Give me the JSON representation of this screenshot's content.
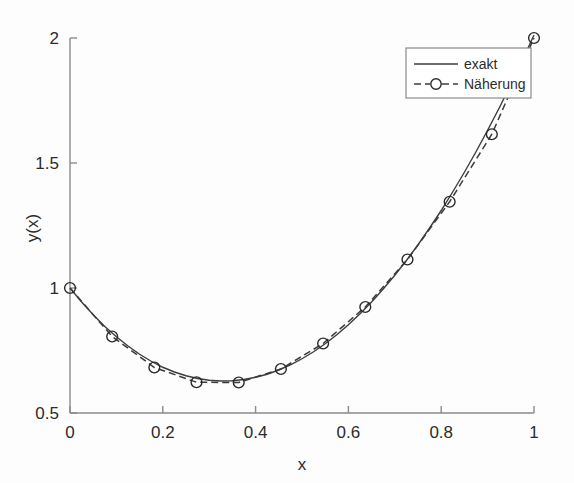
{
  "figure": {
    "background": "#fdfdfd",
    "line_color": "#3c3c3c",
    "axis_color": "#8a8a8a"
  },
  "chart_data": {
    "type": "line",
    "title": "",
    "xlabel": "x",
    "ylabel": "y(x)",
    "xlim": [
      0,
      1
    ],
    "ylim": [
      0.5,
      2
    ],
    "xticks": [
      0,
      0.2,
      0.4,
      0.6,
      0.8,
      1
    ],
    "xtick_labels": [
      "0",
      "0.2",
      "0.4",
      "0.6",
      "0.8",
      "1"
    ],
    "yticks": [
      0.5,
      1,
      1.5,
      2
    ],
    "ytick_labels": [
      "0.5",
      "1",
      "1.5",
      "2"
    ],
    "grid": false,
    "legend_position": "upper right",
    "series": [
      {
        "name": "exakt",
        "style": "solid",
        "marker": "none",
        "color": "#3c3c3c",
        "x": [
          0,
          0.025,
          0.05,
          0.075,
          0.1,
          0.125,
          0.15,
          0.175,
          0.2,
          0.225,
          0.25,
          0.275,
          0.3,
          0.325,
          0.35,
          0.375,
          0.4,
          0.425,
          0.45,
          0.475,
          0.5,
          0.525,
          0.55,
          0.575,
          0.6,
          0.625,
          0.65,
          0.675,
          0.7,
          0.725,
          0.75,
          0.775,
          0.8,
          0.825,
          0.85,
          0.875,
          0.9,
          0.925,
          0.95,
          0.975,
          1
        ],
        "y": [
          1.0,
          0.944,
          0.893,
          0.846,
          0.805,
          0.768,
          0.735,
          0.707,
          0.683,
          0.664,
          0.649,
          0.638,
          0.631,
          0.628,
          0.629,
          0.634,
          0.643,
          0.655,
          0.672,
          0.693,
          0.717,
          0.745,
          0.777,
          0.813,
          0.853,
          0.897,
          0.944,
          0.996,
          1.051,
          1.11,
          1.173,
          1.24,
          1.31,
          1.385,
          1.463,
          1.545,
          1.631,
          1.72,
          1.814,
          1.911,
          2.012
        ]
      },
      {
        "name": "Näherung",
        "style": "dashed",
        "marker": "circle",
        "color": "#3c3c3c",
        "x": [
          0,
          0.0909,
          0.1818,
          0.2727,
          0.3636,
          0.4545,
          0.5455,
          0.6364,
          0.7273,
          0.8182,
          0.9091,
          1
        ],
        "y": [
          1.0,
          0.806,
          0.682,
          0.623,
          0.622,
          0.676,
          0.778,
          0.924,
          1.114,
          1.345,
          1.615,
          2.0
        ]
      }
    ],
    "legend": [
      {
        "label": "exakt",
        "style": "solid",
        "marker": "none"
      },
      {
        "label": "Näherung",
        "style": "dashed",
        "marker": "circle"
      }
    ]
  }
}
